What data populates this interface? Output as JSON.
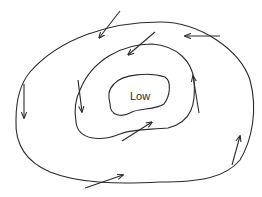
{
  "diagram": {
    "type": "low-pressure-system",
    "center_label": "Low",
    "line_color": "#2b2b2b",
    "isobars": [
      {
        "name": "inner",
        "path": "M114,84 C122,74 150,72 165,77 C172,82 170,96 164,104 C156,110 140,108 132,112 C122,118 110,116 110,104 C108,96 108,90 114,84 Z"
      },
      {
        "name": "middle",
        "path": "M80,90 C92,60 122,44 152,44 C178,46 192,62 194,80 C196,104 192,122 168,128 C150,130 135,128 120,134 C100,142 78,140 76,122 C74,110 75,100 80,90 Z"
      },
      {
        "name": "outer",
        "path": "M30,72 C60,38 110,22 160,22 C200,22 240,50 250,80 C258,110 252,140 240,160 C225,178 200,182 160,182 C120,184 80,184 50,172 C22,160 15,140 16,120 C16,100 20,84 30,72 Z"
      }
    ],
    "wind_arrows": [
      {
        "from": [
          120,
          11
        ],
        "to": [
          99,
          38
        ]
      },
      {
        "from": [
          220,
          36
        ],
        "to": [
          185,
          36
        ]
      },
      {
        "from": [
          24,
          84
        ],
        "to": [
          24,
          118
        ]
      },
      {
        "from": [
          232,
          165
        ],
        "to": [
          240,
          136
        ]
      },
      {
        "from": [
          85,
          188
        ],
        "to": [
          123,
          175
        ]
      },
      {
        "from": [
          155,
          32
        ],
        "to": [
          128,
          55
        ]
      },
      {
        "from": [
          78,
          80
        ],
        "to": [
          82,
          112
        ]
      },
      {
        "from": [
          199,
          113
        ],
        "to": [
          193,
          76
        ]
      },
      {
        "from": [
          122,
          141
        ],
        "to": [
          152,
          122
        ]
      }
    ]
  }
}
